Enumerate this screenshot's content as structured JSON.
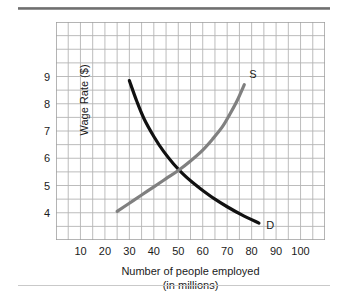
{
  "figure": {
    "background": "#ffffff",
    "rule_color": "#777777"
  },
  "chart_data": {
    "type": "line",
    "title": "",
    "subtitle": "",
    "xlabel": "Number of people employed",
    "xlabel_line2": "(in millions)",
    "ylabel": "Wage Rate ($)",
    "xlim": [
      0,
      110
    ],
    "ylim": [
      3.0,
      11.0
    ],
    "xticks": [
      10,
      20,
      30,
      40,
      50,
      60,
      70,
      80,
      90,
      100
    ],
    "yticks": [
      4,
      5,
      6,
      7,
      8,
      9
    ],
    "grid": true,
    "grid_color": "#b4b4b4",
    "grid_step_x": 5,
    "grid_step_y": 0.5,
    "legend": "inline-labels",
    "equilibrium": {
      "x": 51,
      "y": 5.5
    },
    "series": [
      {
        "name": "Demand",
        "label": "D",
        "color": "#111111",
        "width": 3.2,
        "label_x": 86,
        "label_y": 3.52,
        "points": [
          {
            "x": 30,
            "y": 8.85
          },
          {
            "x": 33,
            "y": 8.1
          },
          {
            "x": 36,
            "y": 7.45
          },
          {
            "x": 40,
            "y": 6.8
          },
          {
            "x": 44,
            "y": 6.25
          },
          {
            "x": 48,
            "y": 5.8
          },
          {
            "x": 52,
            "y": 5.42
          },
          {
            "x": 56,
            "y": 5.1
          },
          {
            "x": 60,
            "y": 4.82
          },
          {
            "x": 65,
            "y": 4.5
          },
          {
            "x": 70,
            "y": 4.22
          },
          {
            "x": 76,
            "y": 3.92
          },
          {
            "x": 83,
            "y": 3.62
          }
        ]
      },
      {
        "name": "Supply",
        "label": "S",
        "color": "#808080",
        "width": 3.2,
        "label_x": 79,
        "label_y": 9.05,
        "points": [
          {
            "x": 25,
            "y": 4.05
          },
          {
            "x": 30,
            "y": 4.35
          },
          {
            "x": 35,
            "y": 4.65
          },
          {
            "x": 40,
            "y": 4.95
          },
          {
            "x": 45,
            "y": 5.25
          },
          {
            "x": 50,
            "y": 5.55
          },
          {
            "x": 55,
            "y": 5.9
          },
          {
            "x": 60,
            "y": 6.3
          },
          {
            "x": 64,
            "y": 6.7
          },
          {
            "x": 68,
            "y": 7.15
          },
          {
            "x": 71,
            "y": 7.6
          },
          {
            "x": 74,
            "y": 8.1
          },
          {
            "x": 77,
            "y": 8.7
          }
        ]
      }
    ]
  }
}
